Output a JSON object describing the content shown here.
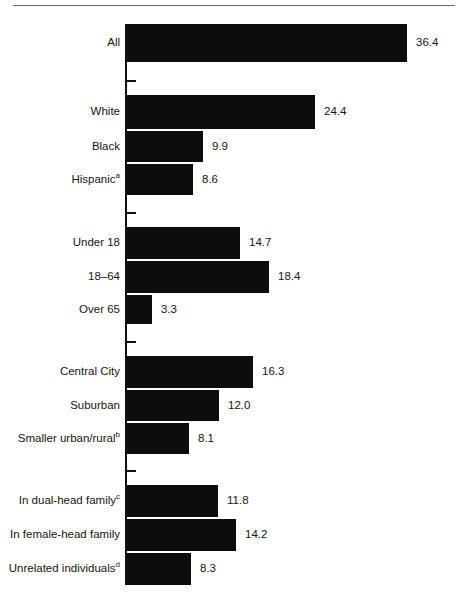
{
  "chart_data": {
    "type": "bar",
    "orientation": "horizontal",
    "title": "",
    "subtitle": "",
    "xlabel": "",
    "ylabel": "",
    "xlim": [
      0,
      36.4
    ],
    "grid": false,
    "legend": false,
    "bar_color": "#0d0d0d",
    "categories": [
      "All",
      "White",
      "Black",
      "Hispanic",
      "Under 18",
      "18–64",
      "Over 65",
      "Central City",
      "Suburban",
      "Smaller urban/rural",
      "In dual-head family",
      "In female-head family",
      "Unrelated individuals"
    ],
    "values": [
      36.4,
      24.4,
      9.9,
      8.6,
      14.7,
      18.4,
      3.3,
      16.3,
      12.0,
      8.1,
      11.8,
      14.2,
      8.3
    ],
    "value_labels": [
      "36.4",
      "24.4",
      "9.9",
      "8.6",
      "14.7",
      "18.4",
      "3.3",
      "16.3",
      "12.0",
      "8.1",
      "11.8",
      "14.2",
      "8.3"
    ],
    "footnote_markers": {
      "Hispanic": "a",
      "Smaller urban/rural": "b",
      "In dual-head family": "c",
      "Unrelated individuals": "d"
    },
    "groups": [
      {
        "name": "total",
        "categories": [
          "All"
        ]
      },
      {
        "name": "race-ethnicity",
        "categories": [
          "White",
          "Black",
          "Hispanic"
        ]
      },
      {
        "name": "age",
        "categories": [
          "Under 18",
          "18–64",
          "Over 65"
        ]
      },
      {
        "name": "residence",
        "categories": [
          "Central City",
          "Suburban",
          "Smaller urban/rural"
        ]
      },
      {
        "name": "family-type",
        "categories": [
          "In dual-head family",
          "In female-head family",
          "Unrelated individuals"
        ]
      }
    ],
    "bars": [
      {
        "label": "All",
        "sup": "",
        "value": 36.4,
        "value_label": "36.4",
        "top": 24,
        "height": 38
      },
      {
        "label": "White",
        "sup": "",
        "value": 24.4,
        "value_label": "24.4",
        "top": 95,
        "height": 34
      },
      {
        "label": "Black",
        "sup": "",
        "value": 9.9,
        "value_label": "9.9",
        "top": 131,
        "height": 31
      },
      {
        "label": "Hispanic",
        "sup": "a",
        "value": 8.6,
        "value_label": "8.6",
        "top": 164,
        "height": 31
      },
      {
        "label": "Under 18",
        "sup": "",
        "value": 14.7,
        "value_label": "14.7",
        "top": 227,
        "height": 32
      },
      {
        "label": "18–64",
        "sup": "",
        "value": 18.4,
        "value_label": "18.4",
        "top": 261,
        "height": 32
      },
      {
        "label": "Over 65",
        "sup": "",
        "value": 3.3,
        "value_label": "3.3",
        "top": 295,
        "height": 29
      },
      {
        "label": "Central City",
        "sup": "",
        "value": 16.3,
        "value_label": "16.3",
        "top": 356,
        "height": 32
      },
      {
        "label": "Suburban",
        "sup": "",
        "value": 12.0,
        "value_label": "12.0",
        "top": 390,
        "height": 31
      },
      {
        "label": "Smaller urban/rural",
        "sup": "b",
        "value": 8.1,
        "value_label": "8.1",
        "top": 423,
        "height": 31
      },
      {
        "label": "In dual-head family",
        "sup": "c",
        "value": 11.8,
        "value_label": "11.8",
        "top": 485,
        "height": 32
      },
      {
        "label": "In female-head family",
        "sup": "",
        "value": 14.2,
        "value_label": "14.2",
        "top": 519,
        "height": 32
      },
      {
        "label": "Unrelated individuals",
        "sup": "d",
        "value": 8.3,
        "value_label": "8.3",
        "top": 553,
        "height": 32
      }
    ],
    "group_ticks": [
      {
        "top": 80
      },
      {
        "top": 212
      },
      {
        "top": 341
      },
      {
        "top": 470
      }
    ],
    "axis": {
      "x": 125,
      "top": 24,
      "bottom": 585,
      "scale_px_per_unit": 7.7,
      "tick_length": 9
    }
  }
}
